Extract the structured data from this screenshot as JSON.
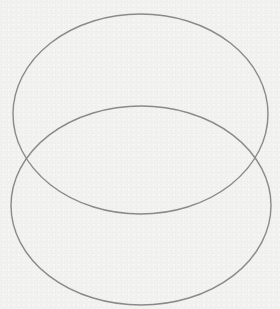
{
  "diagram": {
    "type": "overlapping-ellipses",
    "background_color": "#f1f1f0",
    "stroke_color": "#8a8a8a",
    "stroke_width": 1.4,
    "shapes": [
      {
        "name": "top-ellipse",
        "cx": 140.5,
        "cy": 114,
        "rx": 127.5,
        "ry": 100
      },
      {
        "name": "bottom-ellipse",
        "cx": 141,
        "cy": 205.5,
        "rx": 130,
        "ry": 99.5
      }
    ]
  }
}
